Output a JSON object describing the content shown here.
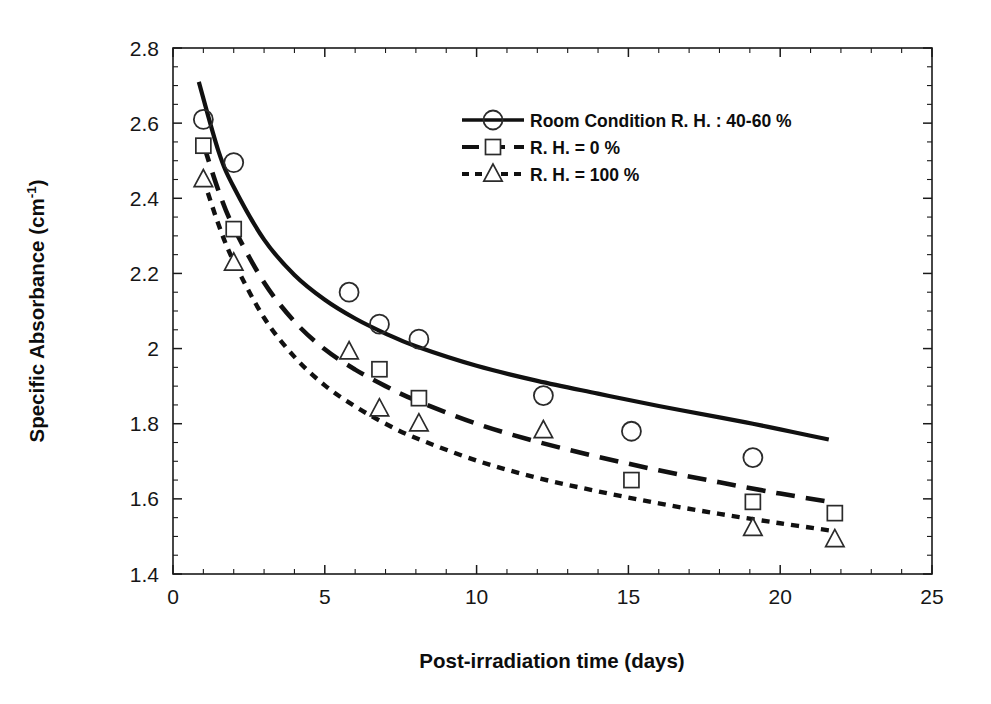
{
  "chart_data": {
    "type": "scatter",
    "title": "",
    "xlabel": "Post-irradiation time (days)",
    "ylabel": "Specific Absorbance (cm",
    "ylabel_superscript": "-1",
    "ylabel_suffix": ")",
    "xlim": [
      0,
      25
    ],
    "ylim": [
      1.4,
      2.8
    ],
    "x_major_step": 5,
    "x_minor_step": 1,
    "y_major_step": 0.2,
    "y_minor_step": 0.05,
    "xticks": [
      "0",
      "5",
      "10",
      "15",
      "20",
      "25"
    ],
    "xtick_values": [
      0,
      5,
      10,
      15,
      20,
      25
    ],
    "yticks": [
      "1.4",
      "1.6",
      "1.8",
      "2",
      "2.2",
      "2.4",
      "2.6",
      "2.8"
    ],
    "ytick_values": [
      1.4,
      1.6,
      1.8,
      2.0,
      2.2,
      2.4,
      2.6,
      2.8
    ],
    "grid": false,
    "frame": "box",
    "tick_direction": "in",
    "legend_position": "upper-right-inside",
    "legend_border": false,
    "colors": {
      "line": "#111111",
      "marker_edge": "#2b2b2b",
      "marker_fill": "#ffffff",
      "axis": "#1a1a1a",
      "text": "#0d0d0d",
      "background": "#ffffff"
    },
    "series": [
      {
        "name": "Room Condition R. H. : 40-60 %",
        "marker": "circle",
        "linestyle": "solid",
        "points": [
          {
            "x": 1.0,
            "y": 2.61
          },
          {
            "x": 2.0,
            "y": 2.495
          },
          {
            "x": 5.8,
            "y": 2.15
          },
          {
            "x": 6.8,
            "y": 2.065
          },
          {
            "x": 8.1,
            "y": 2.025
          },
          {
            "x": 12.2,
            "y": 1.875
          },
          {
            "x": 15.1,
            "y": 1.78
          },
          {
            "x": 19.1,
            "y": 1.71
          }
        ],
        "fit": [
          {
            "x": 0.85,
            "y": 2.71
          },
          {
            "x": 1.5,
            "y": 2.525
          },
          {
            "x": 2.0,
            "y": 2.43
          },
          {
            "x": 3.0,
            "y": 2.29
          },
          {
            "x": 4.0,
            "y": 2.196
          },
          {
            "x": 5.0,
            "y": 2.13
          },
          {
            "x": 6.0,
            "y": 2.08
          },
          {
            "x": 7.0,
            "y": 2.04
          },
          {
            "x": 8.0,
            "y": 2.006
          },
          {
            "x": 10.0,
            "y": 1.954
          },
          {
            "x": 12.0,
            "y": 1.914
          },
          {
            "x": 14.0,
            "y": 1.88
          },
          {
            "x": 16.0,
            "y": 1.847
          },
          {
            "x": 18.0,
            "y": 1.817
          },
          {
            "x": 19.1,
            "y": 1.8
          },
          {
            "x": 20.0,
            "y": 1.785
          },
          {
            "x": 21.0,
            "y": 1.768
          },
          {
            "x": 21.6,
            "y": 1.758
          }
        ]
      },
      {
        "name": "R. H. = 0 %",
        "marker": "square",
        "linestyle": "long-dash",
        "points": [
          {
            "x": 1.0,
            "y": 2.54
          },
          {
            "x": 2.0,
            "y": 2.318
          },
          {
            "x": 6.8,
            "y": 1.945
          },
          {
            "x": 8.1,
            "y": 1.868
          },
          {
            "x": 15.1,
            "y": 1.65
          },
          {
            "x": 19.1,
            "y": 1.592
          },
          {
            "x": 21.8,
            "y": 1.562
          }
        ],
        "fit": [
          {
            "x": 1.0,
            "y": 2.545
          },
          {
            "x": 1.5,
            "y": 2.42
          },
          {
            "x": 2.0,
            "y": 2.322
          },
          {
            "x": 3.0,
            "y": 2.176
          },
          {
            "x": 4.0,
            "y": 2.072
          },
          {
            "x": 5.0,
            "y": 1.998
          },
          {
            "x": 6.0,
            "y": 1.944
          },
          {
            "x": 7.0,
            "y": 1.9
          },
          {
            "x": 8.0,
            "y": 1.862
          },
          {
            "x": 10.0,
            "y": 1.8
          },
          {
            "x": 12.0,
            "y": 1.752
          },
          {
            "x": 14.0,
            "y": 1.712
          },
          {
            "x": 16.0,
            "y": 1.676
          },
          {
            "x": 18.0,
            "y": 1.644
          },
          {
            "x": 20.0,
            "y": 1.614
          },
          {
            "x": 21.8,
            "y": 1.59
          }
        ]
      },
      {
        "name": "R. H. = 100 %",
        "marker": "triangle",
        "linestyle": "short-dash",
        "points": [
          {
            "x": 1.0,
            "y": 2.45
          },
          {
            "x": 2.0,
            "y": 2.228
          },
          {
            "x": 5.8,
            "y": 1.992
          },
          {
            "x": 6.8,
            "y": 1.84
          },
          {
            "x": 8.1,
            "y": 1.8
          },
          {
            "x": 12.2,
            "y": 1.782
          },
          {
            "x": 19.1,
            "y": 1.522
          },
          {
            "x": 21.8,
            "y": 1.492
          }
        ],
        "fit": [
          {
            "x": 1.0,
            "y": 2.452
          },
          {
            "x": 1.5,
            "y": 2.33
          },
          {
            "x": 2.0,
            "y": 2.232
          },
          {
            "x": 3.0,
            "y": 2.082
          },
          {
            "x": 4.0,
            "y": 1.978
          },
          {
            "x": 5.0,
            "y": 1.902
          },
          {
            "x": 6.0,
            "y": 1.846
          },
          {
            "x": 7.0,
            "y": 1.8
          },
          {
            "x": 8.0,
            "y": 1.762
          },
          {
            "x": 10.0,
            "y": 1.702
          },
          {
            "x": 12.0,
            "y": 1.656
          },
          {
            "x": 14.0,
            "y": 1.62
          },
          {
            "x": 16.0,
            "y": 1.588
          },
          {
            "x": 18.0,
            "y": 1.56
          },
          {
            "x": 20.0,
            "y": 1.535
          },
          {
            "x": 21.8,
            "y": 1.514
          }
        ]
      }
    ]
  },
  "legend": {
    "entries": [
      {
        "label": "Room Condition R. H. : 40-60 %",
        "marker": "circle",
        "style": "solid"
      },
      {
        "label": "R. H. = 0 %",
        "marker": "square",
        "style": "long-dash"
      },
      {
        "label": "R. H. = 100 %",
        "marker": "triangle",
        "style": "short-dash"
      }
    ]
  }
}
